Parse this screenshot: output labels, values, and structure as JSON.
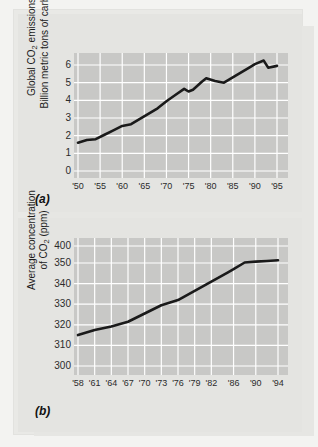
{
  "figure": {
    "panel_a_letter": "(a)",
    "panel_b_letter": "(b)",
    "line_color": "#1a1a1a",
    "plot_bg": "#c8c8c6",
    "grid_color": "#ffffff",
    "panel_bg": "#e4e4e1"
  },
  "chart_data": [
    {
      "id": "a",
      "type": "line",
      "title": "",
      "ylabel_line1": "Global CO",
      "ylabel_sub1": "2",
      "ylabel_line1_tail": " emissions",
      "ylabel_line2": "Billion metric tons of carbon",
      "xlabel": "",
      "ylim": [
        0,
        6.5
      ],
      "xlim": [
        1950,
        1996
      ],
      "grid": true,
      "yticks": [
        0,
        1,
        2,
        3,
        4,
        5,
        6
      ],
      "ytick_labels": [
        "0",
        "1",
        "2",
        "3",
        "4",
        "5",
        "6"
      ],
      "xticks": [
        1950,
        1955,
        1960,
        1965,
        1970,
        1975,
        1980,
        1985,
        1990,
        1995
      ],
      "xtick_labels": [
        "'50",
        "'55",
        "'60",
        "'65",
        "'70",
        "'75",
        "'80",
        "'85",
        "'90",
        "'95"
      ],
      "x": [
        1950,
        1952,
        1954,
        1956,
        1958,
        1960,
        1962,
        1964,
        1966,
        1968,
        1970,
        1972,
        1974,
        1975,
        1976,
        1978,
        1979,
        1981,
        1983,
        1985,
        1987,
        1989,
        1990,
        1992,
        1993,
        1995
      ],
      "values": [
        1.6,
        1.75,
        1.8,
        2.05,
        2.3,
        2.55,
        2.65,
        2.95,
        3.25,
        3.55,
        3.95,
        4.3,
        4.65,
        4.5,
        4.6,
        5.05,
        5.25,
        5.1,
        5.0,
        5.3,
        5.6,
        5.9,
        6.05,
        6.25,
        5.85,
        5.95
      ],
      "legend": null
    },
    {
      "id": "b",
      "type": "line",
      "title": "",
      "ylabel_line1": "Average concentration",
      "ylabel_line2_head": "of CO",
      "ylabel_sub2": "2",
      "ylabel_line2_tail": " (ppm)",
      "xlabel": "",
      "ylim": [
        300,
        400
      ],
      "xlim": [
        1958,
        1995
      ],
      "grid": true,
      "yticks": [
        300,
        310,
        320,
        330,
        340,
        350,
        400
      ],
      "ytick_labels": [
        "300",
        "310",
        "320",
        "330",
        "340",
        "350",
        "400"
      ],
      "xticks": [
        1958,
        1961,
        1964,
        1967,
        1970,
        1973,
        1976,
        1979,
        1982,
        1986,
        1990,
        1994
      ],
      "xtick_labels": [
        "'58",
        "'61",
        "'64",
        "'67",
        "'70",
        "'73",
        "'76",
        "'79",
        "'82",
        "'86",
        "'90",
        "'94"
      ],
      "x": [
        1958,
        1961,
        1964,
        1967,
        1970,
        1973,
        1976,
        1979,
        1982,
        1985,
        1986,
        1988,
        1990,
        1992,
        1994
      ],
      "values": [
        315.0,
        317.5,
        319.2,
        321.5,
        325.5,
        329.5,
        332.0,
        336.5,
        341.0,
        345.5,
        347.0,
        351.5,
        354.0,
        356.0,
        358.0
      ],
      "legend": null
    }
  ]
}
